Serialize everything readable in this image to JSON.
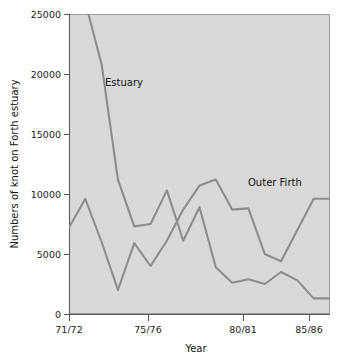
{
  "chart_data": {
    "type": "line",
    "title": "",
    "xlabel": "Year",
    "ylabel": "Numbers of knot on Forth estuary",
    "x": [
      "71/72",
      "72/73",
      "73/74",
      "74/75",
      "75/76",
      "76/77",
      "77/78",
      "78/79",
      "79/80",
      "80/81",
      "81/82",
      "82/83",
      "83/84",
      "84/85",
      "85/86",
      "86/87",
      "87/88"
    ],
    "xtick_positions": [
      "71/72",
      "75/76",
      "80/81",
      "85/86"
    ],
    "xtick_labels": [
      "71/72",
      "75/76",
      "80/81",
      "85/86"
    ],
    "ytick_labels": [
      "0",
      "5000",
      "10000",
      "15000",
      "20000",
      "25000"
    ],
    "ytick_values": [
      0,
      5000,
      10000,
      15000,
      20000,
      25000
    ],
    "ylim": [
      0,
      25000
    ],
    "grid": false,
    "legend_position": "inline-annotation",
    "series": [
      {
        "name": "Estuary",
        "annotation": "Estuary",
        "clipped_at_top": true,
        "values": [
          32000,
          26000,
          20800,
          11200,
          7300,
          7500,
          10300,
          6100,
          8900,
          3900,
          2600,
          2900,
          2500,
          3500,
          2800,
          1300,
          1300
        ]
      },
      {
        "name": "Outer Firth",
        "annotation": "Outer Firth",
        "clipped_at_top": false,
        "values": [
          7200,
          9600,
          6000,
          2000,
          5900,
          4000,
          6100,
          8700,
          10700,
          11200,
          8700,
          8800,
          5000,
          4400,
          7000,
          9600,
          9600
        ]
      }
    ]
  },
  "axes": {
    "y_axis_title": "Numbers of knot on Forth estuary",
    "x_axis_title": "Year"
  },
  "annotations": {
    "estuary_label": "Estuary",
    "outer_firth_label": "Outer Firth"
  },
  "colors": {
    "plot_background": "#d9d9d9",
    "line": "#8d8d8d",
    "axis": "#5c5c5c",
    "text": "#111111",
    "page_background": "#ffffff"
  }
}
